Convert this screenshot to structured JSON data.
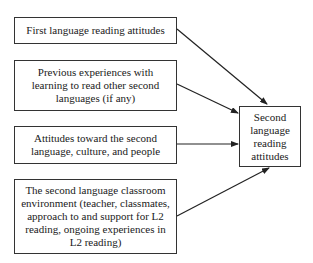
{
  "diagram": {
    "type": "flow",
    "sources": [
      {
        "id": "s1",
        "label": "First language reading attitudes"
      },
      {
        "id": "s2",
        "label": "Previous experiences with learning to read other second languages (if any)"
      },
      {
        "id": "s3",
        "label": "Attitudes toward the second language, culture, and people"
      },
      {
        "id": "s4",
        "label": "The second language classroom environment (teacher, classmates, approach to and support for L2 reading, ongoing experiences in L2 reading)"
      }
    ],
    "target": {
      "id": "t1",
      "label": "Second language reading attitudes"
    },
    "edges": [
      {
        "from": "s1",
        "to": "t1"
      },
      {
        "from": "s2",
        "to": "t1"
      },
      {
        "from": "s3",
        "to": "t1"
      },
      {
        "from": "s4",
        "to": "t1"
      }
    ]
  }
}
